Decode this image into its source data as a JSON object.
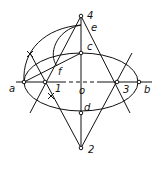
{
  "diagram": {
    "stroke_color": "#111111",
    "background": "#ffffff",
    "points": {
      "4": {
        "label": "4",
        "x": 81,
        "y": 16
      },
      "e": {
        "label": "e",
        "x": 93,
        "y": 27
      },
      "c": {
        "label": "c",
        "x": 81,
        "y": 53
      },
      "f": {
        "label": "f",
        "x": 60,
        "y": 72
      },
      "a": {
        "label": "a",
        "x": 24,
        "y": 82
      },
      "1": {
        "label": "1",
        "x": 45,
        "y": 82
      },
      "o": {
        "label": "o",
        "x": 81,
        "y": 82
      },
      "3": {
        "label": "3",
        "x": 117,
        "y": 82
      },
      "b": {
        "label": "b",
        "x": 139,
        "y": 82
      },
      "d": {
        "label": "d",
        "x": 81,
        "y": 113
      },
      "2": {
        "label": "2",
        "x": 81,
        "y": 148
      }
    },
    "labels": {
      "p4": "4",
      "pe": "e",
      "pc": "c",
      "pf": "f",
      "pa": "a",
      "p1": "1",
      "po": "o",
      "p3": "3",
      "pb": "b",
      "pd": "d",
      "p2": "2"
    }
  }
}
